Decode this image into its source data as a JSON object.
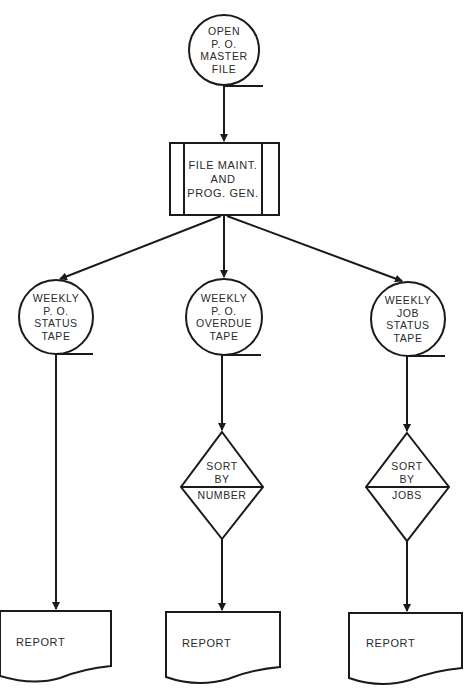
{
  "diagram": {
    "type": "flowchart",
    "stroke_color": "#1a1a1a",
    "text_color": "#2a2a2a",
    "nodes": {
      "master_file": {
        "shape": "magnetic-tape",
        "label": "OPEN\nP. O.\nMASTER\nFILE"
      },
      "file_maint": {
        "shape": "predefined-process",
        "label": "FILE MAINT.\nAND\nPROG. GEN."
      },
      "tape_po_status": {
        "shape": "magnetic-tape",
        "label": "WEEKLY\nP. O.\nSTATUS\nTAPE"
      },
      "tape_po_overdue": {
        "shape": "magnetic-tape",
        "label": "WEEKLY\nP. O.\nOVERDUE\nTAPE"
      },
      "tape_job_status": {
        "shape": "magnetic-tape",
        "label": "WEEKLY\nJOB\nSTATUS\nTAPE"
      },
      "sort_number": {
        "shape": "sort-diamond",
        "label_top": "SORT\nBY",
        "label_bottom": "NUMBER"
      },
      "sort_jobs": {
        "shape": "sort-diamond",
        "label_top": "SORT\nBY",
        "label_bottom": "JOBS"
      },
      "report_1": {
        "shape": "document",
        "label": "REPORT"
      },
      "report_2": {
        "shape": "document",
        "label": "REPORT"
      },
      "report_3": {
        "shape": "document",
        "label": "REPORT"
      }
    },
    "edges": [
      {
        "from": "master_file",
        "to": "file_maint"
      },
      {
        "from": "file_maint",
        "to": "tape_po_status"
      },
      {
        "from": "file_maint",
        "to": "tape_po_overdue"
      },
      {
        "from": "file_maint",
        "to": "tape_job_status"
      },
      {
        "from": "tape_po_status",
        "to": "report_1"
      },
      {
        "from": "tape_po_overdue",
        "to": "sort_number"
      },
      {
        "from": "sort_number",
        "to": "report_2"
      },
      {
        "from": "tape_job_status",
        "to": "sort_jobs"
      },
      {
        "from": "sort_jobs",
        "to": "report_3"
      }
    ]
  }
}
